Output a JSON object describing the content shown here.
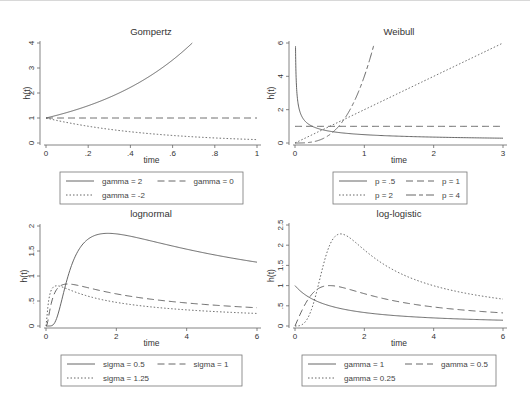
{
  "chart_data": [
    {
      "type": "line",
      "title": "Gompertz",
      "xlabel": "time",
      "ylabel": "h(t)",
      "xlim": [
        0,
        1
      ],
      "ylim": [
        0,
        4
      ],
      "xticks": [
        0,
        0.2,
        0.4,
        0.6,
        0.8,
        1
      ],
      "xtick_labels": [
        "0",
        ".2",
        ".4",
        ".6",
        ".8",
        "1"
      ],
      "yticks": [
        0,
        1,
        2,
        3,
        4
      ],
      "ytick_labels": [
        "0",
        "1",
        "2",
        "3",
        "4"
      ],
      "grid": false,
      "legend_position": "bottom",
      "series": [
        {
          "name": "gamma = 2",
          "style": "solid",
          "x": [
            0,
            0.1,
            0.2,
            0.3,
            0.4,
            0.5,
            0.6,
            0.693
          ],
          "values": [
            1,
            1.22,
            1.49,
            1.82,
            2.23,
            2.72,
            3.32,
            4.0
          ]
        },
        {
          "name": "gamma = 0",
          "style": "dash",
          "x": [
            0,
            0.2,
            0.4,
            0.6,
            0.8,
            1
          ],
          "values": [
            1,
            1,
            1,
            1,
            1,
            1
          ]
        },
        {
          "name": "gamma = -2",
          "style": "dot",
          "x": [
            0,
            0.1,
            0.2,
            0.3,
            0.4,
            0.5,
            0.6,
            0.7,
            0.8,
            0.9,
            1
          ],
          "values": [
            1,
            0.82,
            0.67,
            0.55,
            0.45,
            0.37,
            0.3,
            0.25,
            0.2,
            0.17,
            0.14
          ]
        }
      ]
    },
    {
      "type": "line",
      "title": "Weibull",
      "xlabel": "time",
      "ylabel": "h(t)",
      "xlim": [
        0,
        3
      ],
      "ylim": [
        0,
        6
      ],
      "xticks": [
        0,
        1,
        2,
        3
      ],
      "xtick_labels": [
        "0",
        "1",
        "2",
        "3"
      ],
      "yticks": [
        0,
        2,
        4,
        6
      ],
      "ytick_labels": [
        "0",
        "2",
        "4",
        "6"
      ],
      "grid": false,
      "legend_position": "bottom",
      "series": [
        {
          "name": "p = .5",
          "style": "solid",
          "x": [
            0.007,
            0.02,
            0.05,
            0.1,
            0.2,
            0.4,
            0.7,
            1,
            1.5,
            2,
            2.5,
            3
          ],
          "values": [
            5.8,
            3.54,
            2.24,
            1.58,
            1.12,
            0.79,
            0.6,
            0.5,
            0.41,
            0.35,
            0.32,
            0.29
          ]
        },
        {
          "name": "p = 1",
          "style": "dash",
          "x": [
            0,
            1,
            2,
            3
          ],
          "values": [
            1,
            1,
            1,
            1
          ]
        },
        {
          "name": "p = 2",
          "style": "dot",
          "x": [
            0,
            1,
            2,
            3
          ],
          "values": [
            0,
            2,
            4,
            6
          ]
        },
        {
          "name": "p = 4",
          "style": "longdash-dash",
          "x": [
            0,
            0.2,
            0.4,
            0.6,
            0.8,
            1.0,
            1.14
          ],
          "values": [
            0,
            0.03,
            0.26,
            0.86,
            2.05,
            4.0,
            5.9
          ]
        }
      ]
    },
    {
      "type": "line",
      "title": "lognormal",
      "xlabel": "time",
      "ylabel": "h(t)",
      "xlim": [
        0,
        6
      ],
      "ylim": [
        0,
        2
      ],
      "xticks": [
        0,
        2,
        4,
        6
      ],
      "xtick_labels": [
        "0",
        "2",
        "4",
        "6"
      ],
      "yticks": [
        0,
        0.5,
        1,
        1.5,
        2
      ],
      "ytick_labels": [
        "0",
        ".5",
        "1",
        "1.5",
        "2"
      ],
      "grid": false,
      "legend_position": "bottom",
      "series": [
        {
          "name": "sigma = 0.5",
          "style": "solid",
          "param": 0.5,
          "x": [
            0,
            0.5,
            1,
            1.5,
            1.75,
            2,
            3,
            4,
            5,
            6
          ],
          "values": [
            0,
            0.84,
            1.6,
            1.83,
            1.84,
            1.83,
            1.65,
            1.5,
            1.38,
            1.28
          ]
        },
        {
          "name": "sigma = 1",
          "style": "dash",
          "param": 1,
          "x": [
            0,
            0.25,
            0.5,
            0.6,
            1,
            2,
            3,
            4,
            5,
            6
          ],
          "values": [
            0,
            0.57,
            0.83,
            0.84,
            0.8,
            0.66,
            0.55,
            0.47,
            0.41,
            0.37
          ]
        },
        {
          "name": "sigma = 1.25",
          "style": "dot",
          "param": 1.25,
          "x": [
            0,
            0.1,
            0.3,
            0.5,
            1,
            2,
            3,
            4,
            5,
            6
          ],
          "values": [
            0,
            0.55,
            0.8,
            0.76,
            0.64,
            0.47,
            0.38,
            0.32,
            0.28,
            0.25
          ]
        }
      ]
    },
    {
      "type": "line",
      "title": "log-logistic",
      "xlabel": "time",
      "ylabel": "h(t)",
      "xlim": [
        0,
        6
      ],
      "ylim": [
        0,
        2.5
      ],
      "xticks": [
        0,
        2,
        4,
        6
      ],
      "xtick_labels": [
        "0",
        "2",
        "4",
        "6"
      ],
      "yticks": [
        0,
        0.5,
        1,
        1.5,
        2,
        2.5
      ],
      "ytick_labels": [
        "0",
        ".5",
        "1",
        "1.5",
        "2",
        "2.5"
      ],
      "grid": false,
      "legend_position": "bottom",
      "series": [
        {
          "name": "gamma = 1",
          "style": "solid",
          "param": 1,
          "x": [
            0,
            1,
            2,
            3,
            4,
            5,
            6
          ],
          "values": [
            1,
            0.5,
            0.33,
            0.25,
            0.2,
            0.17,
            0.14
          ]
        },
        {
          "name": "gamma = 0.5",
          "style": "dash",
          "param": 0.5,
          "x": [
            0,
            0.5,
            1,
            2,
            3,
            4,
            5,
            6
          ],
          "values": [
            0,
            0.8,
            1,
            0.8,
            0.6,
            0.47,
            0.38,
            0.32
          ]
        },
        {
          "name": "gamma = 0.25",
          "style": "dot",
          "param": 0.25,
          "x": [
            0,
            0.5,
            1,
            1.32,
            2,
            3,
            4,
            5,
            6
          ],
          "values": [
            0,
            0.47,
            2,
            2.28,
            1.88,
            1.33,
            1.0,
            0.8,
            0.67
          ]
        }
      ]
    }
  ],
  "colors": {
    "line": "#555555",
    "axis": "#666666",
    "legend_border": "#777777",
    "background": "#ffffff"
  }
}
